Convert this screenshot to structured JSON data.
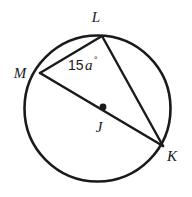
{
  "figure": {
    "name": "circle-with-inscribed-angle",
    "background_color": "#ffffff",
    "stroke_color": "#1a1a1a",
    "width": 192,
    "height": 197
  },
  "circle": {
    "center_x": 97.5,
    "center_y": 108.5,
    "radius": 73,
    "stroke_width": 2.6,
    "color": "#1a1a1a"
  },
  "center_point": {
    "label": "J",
    "x": 103,
    "y": 107,
    "label_x": 95,
    "label_y": 132,
    "dot_radius": 3.4,
    "color": "#1a1a1a"
  },
  "vertices": [
    {
      "id": "L",
      "label": "L",
      "x": 102,
      "y": 36,
      "label_x": 96,
      "label_y": 22
    },
    {
      "id": "M",
      "label": "M",
      "x": 40,
      "y": 73,
      "label_x": 20,
      "label_y": 78
    },
    {
      "id": "K",
      "label": "K",
      "x": 163,
      "y": 146,
      "label_x": 172,
      "label_y": 161
    }
  ],
  "chords": [
    {
      "id": "ML",
      "name": "chord-m-l",
      "x1": 40,
      "y1": 73,
      "x2": 102,
      "y2": 36,
      "stroke_width": 2.4
    },
    {
      "id": "MK",
      "name": "diameter-m-k",
      "x1": 40,
      "y1": 73,
      "x2": 163,
      "y2": 146,
      "stroke_width": 2.6
    },
    {
      "id": "LK",
      "name": "chord-l-k",
      "x1": 102,
      "y1": 36,
      "x2": 163,
      "y2": 146,
      "stroke_width": 2.4
    }
  ],
  "angle_label": {
    "full_text": "15a°",
    "number": "15",
    "variable": "a",
    "degree_symbol": "°",
    "x": 68,
    "y": 70,
    "at_vertex": "L"
  }
}
